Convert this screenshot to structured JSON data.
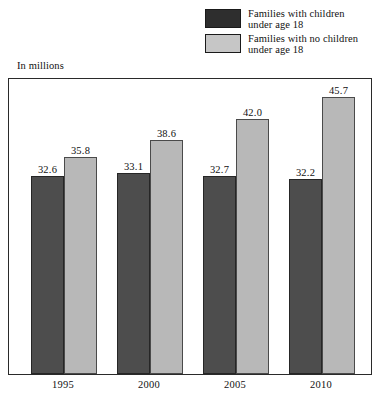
{
  "axis_note": "In millions",
  "legend": {
    "items": [
      {
        "label": "Families with children\nunder age 18",
        "swatch": "dark",
        "color": "#2e2e2e"
      },
      {
        "label": "Families with no children\nunder age 18",
        "swatch": "light",
        "color": "#c6c6c6"
      }
    ]
  },
  "chart_data": {
    "type": "bar",
    "title": "",
    "subtitle": "",
    "xlabel": "",
    "ylabel": "In millions",
    "categories": [
      "1995",
      "2000",
      "2005",
      "2010"
    ],
    "series": [
      {
        "name": "Families with children under age 18",
        "color": "#4d4d4d",
        "values": [
          32.6,
          33.1,
          32.7,
          32.2
        ],
        "labels": [
          "32.6",
          "33.1",
          "32.7",
          "32.2"
        ]
      },
      {
        "name": "Families with no children under age 18",
        "color": "#b8b8b8",
        "values": [
          35.8,
          38.6,
          42.0,
          45.7
        ],
        "labels": [
          "35.8",
          "38.6",
          "42.0",
          "45.7"
        ]
      }
    ],
    "ylim": [
      0,
      49
    ],
    "grid": false,
    "legend_position": "top-right",
    "axis_visible": {
      "left": true,
      "right": true,
      "top": true,
      "bottom": true
    }
  }
}
